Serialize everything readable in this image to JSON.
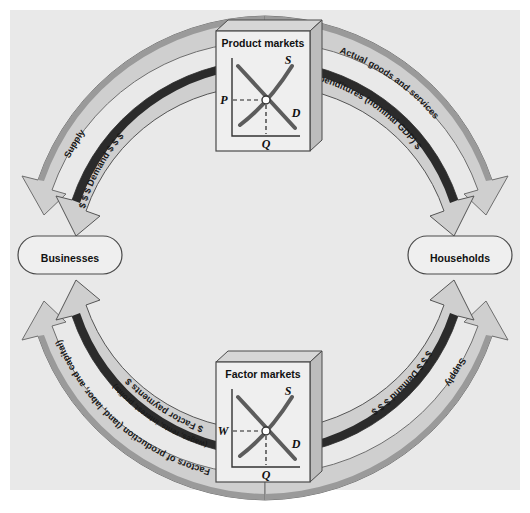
{
  "figure": {
    "background_color": "#e9e9e9",
    "page_color": "#ffffff"
  },
  "sectors": {
    "businesses": "Businesses",
    "households": "Households"
  },
  "markets": {
    "product": {
      "title": "Product markets",
      "supply_label": "S",
      "demand_label": "D",
      "price_axis_label": "P",
      "quantity_axis_label": "Q"
    },
    "factor": {
      "title": "Factor markets",
      "supply_label": "S",
      "demand_label": "D",
      "price_axis_label": "W",
      "quantity_axis_label": "Q"
    }
  },
  "flows": {
    "top_left_outer": "Supply",
    "top_left_inner": "$ $ $ Demand $ $ $",
    "top_right_outer": "Actual goods and services",
    "top_right_inner": "$ Expenditures (nominal GDP) $",
    "bottom_left_outer_line1": "Factors of production (land, labor, and capital)",
    "bottom_left_inner_line1": "$ Factor payments  $",
    "bottom_left_inner_line2": "(wages, rents, interest, profits)",
    "bottom_right_inner": "$ $ $ Demand $ $ $",
    "bottom_right_outer": "Supply"
  },
  "colors": {
    "ribbon_light": "#cfcfcf",
    "ribbon_mid": "#9a9a9a",
    "ribbon_dark": "#6e6e6e",
    "ribbon_darkest": "#2b2b2b",
    "box_face": "#efefef",
    "box_side": "#c2c2c2",
    "curve": "#4a4a4a",
    "outline": "#4a4a4a"
  }
}
